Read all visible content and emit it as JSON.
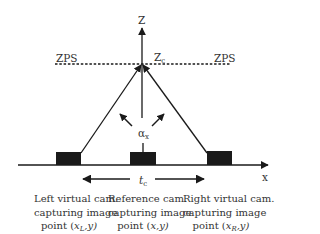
{
  "diagram": {
    "axes": {
      "z_label": "Z",
      "x_label": "x"
    },
    "zps": {
      "left_label": "ZPS",
      "right_label": "ZPS",
      "convergence_label": "Z",
      "convergence_sub": "c"
    },
    "angle": {
      "label": "α",
      "sub": "x"
    },
    "baseline": {
      "label": "t",
      "sub": "c"
    },
    "cameras": [
      {
        "name": "left",
        "line1": "Left virtual cam.",
        "line2": "capturing image",
        "line3_prefix": "point (",
        "line3_var": "x",
        "line3_sub": "L",
        "line3_suffix": ",y)"
      },
      {
        "name": "reference",
        "line1": "Reference cam.",
        "line2": "capturing image",
        "line3_prefix": "point (",
        "line3_var": "x",
        "line3_sub": "",
        "line3_suffix": ",y)"
      },
      {
        "name": "right",
        "line1": "Right virtual cam.",
        "line2": "capturing image",
        "line3_prefix": "point (",
        "line3_var": "x",
        "line3_sub": "R",
        "line3_suffix": ",y)"
      }
    ],
    "colors": {
      "ink": "#1a1a1a",
      "camera_fill": "#1a1a1a",
      "background": "#ffffff"
    }
  }
}
